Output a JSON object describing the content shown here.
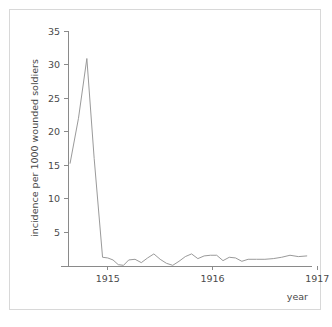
{
  "chart_data": {
    "type": "line",
    "title": "",
    "subtitle": "",
    "xlabel": "year",
    "ylabel": "incidence per 1000 wounded soldiers",
    "xlim": [
      1914.62,
      1916.95
    ],
    "ylim": [
      0,
      35
    ],
    "grid": false,
    "legend": null,
    "yticks": [
      5,
      10,
      15,
      20,
      25,
      30,
      35
    ],
    "ytick_labels": [
      "5",
      "10",
      "15",
      "20",
      "25",
      "30",
      "35"
    ],
    "xticks": [
      1915,
      1916,
      1917
    ],
    "xtick_labels": [
      "1915",
      "1916",
      "1917"
    ],
    "series": [
      {
        "name": "incidence",
        "color": "#9a9a9a",
        "x": [
          1914.64,
          1914.72,
          1914.8,
          1914.87,
          1914.95,
          1915.0,
          1915.05,
          1915.1,
          1915.15,
          1915.2,
          1915.26,
          1915.32,
          1915.38,
          1915.44,
          1915.5,
          1915.56,
          1915.62,
          1915.68,
          1915.74,
          1915.8,
          1915.86,
          1915.92,
          1915.98,
          1916.04,
          1916.1,
          1916.16,
          1916.22,
          1916.28,
          1916.34,
          1916.42,
          1916.5,
          1916.58,
          1916.66,
          1916.74,
          1916.82,
          1916.9
        ],
        "y": [
          15.3,
          22.0,
          30.9,
          16.0,
          1.3,
          1.2,
          0.9,
          0.2,
          0.1,
          0.9,
          1.0,
          0.5,
          1.2,
          1.8,
          1.0,
          0.4,
          0.1,
          0.7,
          1.4,
          1.8,
          1.1,
          1.5,
          1.6,
          1.6,
          0.8,
          1.3,
          1.2,
          0.7,
          1.0,
          1.0,
          1.0,
          1.1,
          1.3,
          1.6,
          1.4,
          1.5
        ]
      }
    ]
  }
}
